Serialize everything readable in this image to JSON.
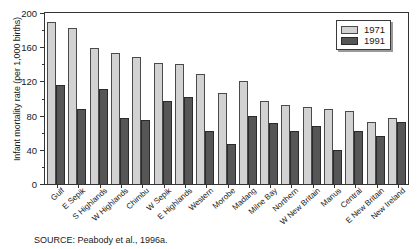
{
  "chart_data": {
    "type": "bar",
    "title": "",
    "xlabel": "",
    "ylabel": "Infant mortality rate (per 1,000 births)",
    "ylim": [
      0,
      200
    ],
    "ytick_values": [
      0,
      40,
      80,
      120,
      160,
      200
    ],
    "ytick_labels": [
      "0",
      "40",
      "80",
      "120",
      "160",
      "200"
    ],
    "minor_tick_step": 20,
    "grid": false,
    "legend_position": "top-right",
    "categories": [
      "Gulf",
      "E Sepik",
      "S Highlands",
      "W Highlands",
      "Chimbu",
      "W Sepik",
      "E Highlands",
      "Western",
      "Morobe",
      "Madang",
      "Milne Bay",
      "Northern",
      "W New Britain",
      "Manus",
      "Central",
      "E New Britain",
      "New Ireland"
    ],
    "series": [
      {
        "name": "1971",
        "color": "#d2d2d2",
        "values": [
          190,
          183,
          159,
          153,
          148,
          142,
          140,
          129,
          107,
          121,
          97,
          92,
          90,
          88,
          85,
          72,
          77
        ]
      },
      {
        "name": "1991",
        "color": "#565656",
        "values": [
          116,
          88,
          111,
          77,
          75,
          97,
          102,
          62,
          47,
          80,
          71,
          62,
          68,
          40,
          62,
          56,
          72
        ]
      }
    ]
  },
  "legend": {
    "entries": [
      {
        "label": "1971"
      },
      {
        "label": "1991"
      }
    ]
  },
  "source": {
    "text": "SOURCE: Peabody et al., 1996a."
  }
}
